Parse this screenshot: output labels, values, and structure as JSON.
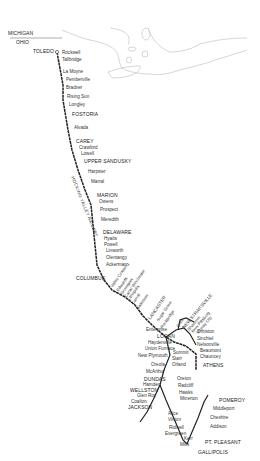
{
  "map": {
    "title": "Hocking Valley Railway",
    "railway_label": "HOCKING VALLEY RAILWAY",
    "states": {
      "north": "MICHIGAN",
      "south": "OHIO"
    },
    "colors": {
      "line": "#222222",
      "water": "#bbbbbb",
      "text": "#333333",
      "background": "#ffffff"
    },
    "main_line_stations": [
      {
        "name": "TOLEDO",
        "major": true
      },
      {
        "name": "Rockwell",
        "major": false
      },
      {
        "name": "Tallbridge",
        "major": false
      },
      {
        "name": "La Moyne",
        "major": false
      },
      {
        "name": "Pemberville",
        "major": false
      },
      {
        "name": "Bradner",
        "major": false
      },
      {
        "name": "Rising Sun",
        "major": false
      },
      {
        "name": "Longley",
        "major": false
      },
      {
        "name": "FOSTORIA",
        "major": true
      },
      {
        "name": "Alvada",
        "major": false
      },
      {
        "name": "CAREY",
        "major": true
      },
      {
        "name": "Crawford",
        "major": false
      },
      {
        "name": "Lowell",
        "major": false
      },
      {
        "name": "UPPER SANDUSKY",
        "major": true
      },
      {
        "name": "Harpster",
        "major": false
      },
      {
        "name": "Marral",
        "major": false
      },
      {
        "name": "MARION",
        "major": true
      },
      {
        "name": "Owens",
        "major": false
      },
      {
        "name": "Prospect",
        "major": false
      },
      {
        "name": "Meredith",
        "major": false
      },
      {
        "name": "DELAWARE",
        "major": true
      },
      {
        "name": "Hyatts",
        "major": false
      },
      {
        "name": "Powell",
        "major": false
      },
      {
        "name": "Linworth",
        "major": false
      },
      {
        "name": "Olentangy",
        "major": false
      },
      {
        "name": "Ackerman",
        "major": false
      },
      {
        "name": "COLUMBUS",
        "major": true
      }
    ],
    "southeast_stations": [
      {
        "name": "Valley Crossing"
      },
      {
        "name": "Edwards"
      },
      {
        "name": "Groveport"
      },
      {
        "name": "Canal Winchester"
      },
      {
        "name": "Lithopolis"
      },
      {
        "name": "Carroll"
      },
      {
        "name": "Baltimore"
      },
      {
        "name": "LANCASTER"
      },
      {
        "name": "Sugar Grove"
      },
      {
        "name": "Rockbridge"
      },
      {
        "name": "Gore"
      },
      {
        "name": "NEW STRAITSVILLE"
      },
      {
        "name": "Shawnee"
      },
      {
        "name": "New Pittsburg"
      },
      {
        "name": "Murray City"
      }
    ],
    "branch_labels": [
      {
        "name": "Enterprise"
      },
      {
        "name": "LOGAN"
      },
      {
        "name": "Haydenville"
      },
      {
        "name": "Union Furnace"
      },
      {
        "name": "Orbiston"
      },
      {
        "name": "Sinchtel"
      },
      {
        "name": "Nelsonville"
      },
      {
        "name": "Beaumont"
      },
      {
        "name": "Chauncey"
      },
      {
        "name": "ATHENS"
      },
      {
        "name": "New Plymouth"
      },
      {
        "name": "Summit"
      },
      {
        "name": "Starr"
      },
      {
        "name": "Orland"
      },
      {
        "name": "Oreola"
      },
      {
        "name": "McArthur"
      },
      {
        "name": "DUNDAS"
      },
      {
        "name": "Hamden"
      },
      {
        "name": "WELLSTON"
      },
      {
        "name": "Glen Roy"
      },
      {
        "name": "Coalton"
      },
      {
        "name": "JACKSON"
      },
      {
        "name": "Oreton"
      },
      {
        "name": "Radcliff"
      },
      {
        "name": "Hawks"
      },
      {
        "name": "Minerton"
      },
      {
        "name": "Alice"
      },
      {
        "name": "Vinton"
      },
      {
        "name": "Ridwell"
      },
      {
        "name": "Evergreen"
      },
      {
        "name": "Kerr"
      },
      {
        "name": "Mills"
      },
      {
        "name": "GALLIPOLIS"
      },
      {
        "name": "PT. PLEASANT"
      },
      {
        "name": "Addison"
      },
      {
        "name": "Cheshire"
      },
      {
        "name": "Middleport"
      },
      {
        "name": "POMEROY"
      }
    ]
  }
}
